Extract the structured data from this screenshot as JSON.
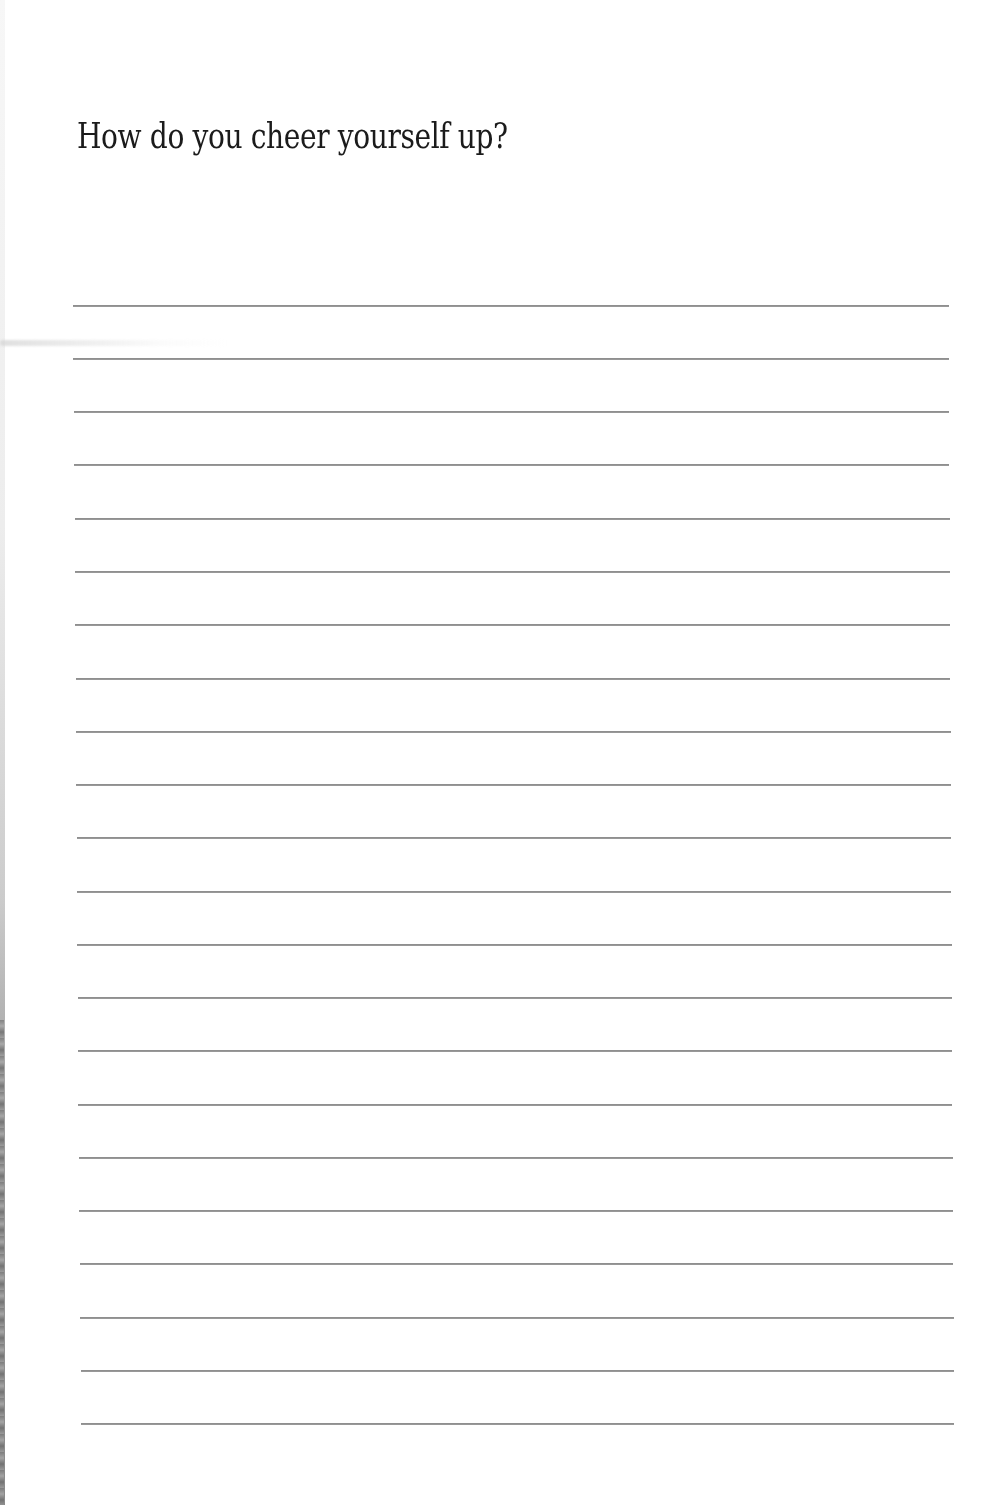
{
  "page": {
    "title": "How do you cheer yourself up?",
    "line_count": 22,
    "line_color": "#8f8f8f",
    "text_color": "#1b1b1b",
    "lines": [
      {
        "y": 305,
        "x1": 73,
        "x2": 949
      },
      {
        "y": 358,
        "x1": 73,
        "x2": 949
      },
      {
        "y": 411,
        "x1": 74,
        "x2": 949
      },
      {
        "y": 464,
        "x1": 74,
        "x2": 949
      },
      {
        "y": 518,
        "x1": 75,
        "x2": 950
      },
      {
        "y": 571,
        "x1": 75,
        "x2": 950
      },
      {
        "y": 624,
        "x1": 75,
        "x2": 950
      },
      {
        "y": 678,
        "x1": 76,
        "x2": 950
      },
      {
        "y": 731,
        "x1": 76,
        "x2": 951
      },
      {
        "y": 784,
        "x1": 76,
        "x2": 951
      },
      {
        "y": 837,
        "x1": 77,
        "x2": 951
      },
      {
        "y": 891,
        "x1": 77,
        "x2": 951
      },
      {
        "y": 944,
        "x1": 77,
        "x2": 952
      },
      {
        "y": 997,
        "x1": 78,
        "x2": 952
      },
      {
        "y": 1050,
        "x1": 78,
        "x2": 952
      },
      {
        "y": 1104,
        "x1": 78,
        "x2": 952
      },
      {
        "y": 1157,
        "x1": 79,
        "x2": 953
      },
      {
        "y": 1210,
        "x1": 79,
        "x2": 953
      },
      {
        "y": 1263,
        "x1": 80,
        "x2": 953
      },
      {
        "y": 1317,
        "x1": 80,
        "x2": 954
      },
      {
        "y": 1370,
        "x1": 81,
        "x2": 954
      },
      {
        "y": 1423,
        "x1": 81,
        "x2": 954
      }
    ]
  }
}
